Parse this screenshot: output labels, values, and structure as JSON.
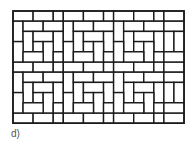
{
  "figure": {
    "label": "d)",
    "line_color": "#1a1a1a",
    "fill_color": "#ffffff"
  }
}
